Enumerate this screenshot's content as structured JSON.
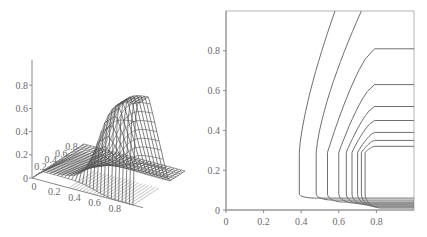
{
  "chart_data": [
    {
      "type": "surface3d",
      "title": "",
      "xlabel": "",
      "ylabel": "",
      "zlabel": "",
      "x_ticks": [
        "0",
        "0.2",
        "0.4",
        "0.6",
        "0.8"
      ],
      "y_ticks": [
        "0",
        "0.2",
        "0.4",
        "0.6",
        "0.8"
      ],
      "z_ticks": [
        "0",
        "0.2",
        "0.4",
        "0.6",
        "0.8"
      ],
      "xlim": [
        0,
        1
      ],
      "ylim": [
        0,
        1
      ],
      "zlim": [
        0,
        1
      ],
      "description": "Mesh surface near zero for x < ~0.4, rising to a plateau of about 0.8-0.9 for x > ~0.8 and y between ~0.05 and ~0.3, dropping sharply to 0 at y = 0",
      "peak_value": 0.85
    },
    {
      "type": "contour",
      "title": "",
      "xlabel": "",
      "ylabel": "",
      "x_ticks": [
        "0",
        "0.2",
        "0.4",
        "0.6",
        "0.8"
      ],
      "y_ticks": [
        "0",
        "0.2",
        "0.4",
        "0.6",
        "0.8"
      ],
      "xlim": [
        0,
        1
      ],
      "ylim": [
        0,
        1
      ],
      "grid": false,
      "contours": [
        {
          "left_x": 0.39,
          "top": "x",
          "top_value": 0.58
        },
        {
          "left_x": 0.48,
          "top": "x",
          "top_value": 0.72
        },
        {
          "left_x": 0.54,
          "top": "y",
          "top_value": 0.81
        },
        {
          "left_x": 0.6,
          "top": "y",
          "top_value": 0.63
        },
        {
          "left_x": 0.64,
          "top": "y",
          "top_value": 0.52
        },
        {
          "left_x": 0.67,
          "top": "y",
          "top_value": 0.45
        },
        {
          "left_x": 0.7,
          "top": "y",
          "top_value": 0.39
        },
        {
          "left_x": 0.72,
          "top": "y",
          "top_value": 0.35
        },
        {
          "left_x": 0.74,
          "top": "y",
          "top_value": 0.32
        }
      ],
      "bottom_levels_y": [
        0.06,
        0.05,
        0.04,
        0.035,
        0.03,
        0.025,
        0.02,
        0.015,
        0.01
      ]
    }
  ]
}
